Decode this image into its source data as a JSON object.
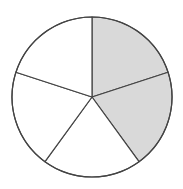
{
  "diagram": {
    "type": "fraction-circle",
    "total_parts": 5,
    "shaded_parts": 2,
    "fraction": "2/5",
    "center": [
      92,
      97
    ],
    "radius": 80,
    "start_angle_deg": -90,
    "shaded_indices": [
      0,
      1
    ],
    "colors": {
      "shaded": "#d9d9d9",
      "unshaded": "#ffffff",
      "stroke": "#444444",
      "background": "#ffffff"
    },
    "stroke_width": 1.2
  }
}
